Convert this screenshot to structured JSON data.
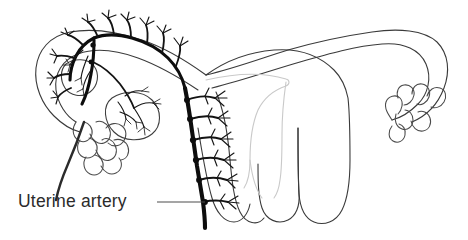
{
  "figure": {
    "kind": "anatomical-line-drawing",
    "background_color": "#ffffff",
    "orientation": "anterior view, coronal section of uterus"
  },
  "labels": [
    {
      "id": "uterine-artery",
      "text": "Uterine artery",
      "x": 18,
      "y": 207,
      "color": "#2b2b2b",
      "font_size_px": 17.5,
      "leader": {
        "from_x": 157,
        "from_y": 202,
        "to_x": 205,
        "to_y": 202,
        "color": "#4c4c4c"
      }
    }
  ],
  "colors": {
    "organ_outline": "#3a3a3a",
    "cavity_outline": "#c9c9c9",
    "artery": "#0d0d0d",
    "artery_branch": "#131313",
    "label_text": "#2b2b2b",
    "leader_line": "#4c4c4c",
    "background": "#ffffff"
  },
  "structures": [
    {
      "id": "left-fallopian-tube",
      "name": "Left fallopian tube",
      "side": "left",
      "rendering": "dark outline"
    },
    {
      "id": "right-fallopian-tube",
      "name": "Right fallopian tube",
      "side": "right",
      "rendering": "dark outline"
    },
    {
      "id": "left-fimbriae",
      "name": "Left fimbriae",
      "side": "left",
      "rendering": "finger-like outline"
    },
    {
      "id": "right-fimbriae",
      "name": "Right fimbriae",
      "side": "right",
      "rendering": "finger-like outline"
    },
    {
      "id": "left-ovary",
      "name": "Left ovary",
      "side": "left",
      "rendering": "oval outline with vessels"
    },
    {
      "id": "uterine-body",
      "name": "Uterine body",
      "side": "center",
      "rendering": "dark outline"
    },
    {
      "id": "uterine-cavity",
      "name": "Uterine cavity",
      "side": "center",
      "rendering": "pale gray triangular outline"
    },
    {
      "id": "cervix",
      "name": "Cervix",
      "side": "center",
      "rendering": "dark outline, lower lobe"
    },
    {
      "id": "uterine-artery-trunk",
      "name": "Uterine artery ascending trunk",
      "side": "left",
      "rendering": "heavy black line with nodes"
    },
    {
      "id": "arcuate-arteries",
      "name": "Arcuate arteries",
      "side": "left",
      "rendering": "branching black twigs"
    },
    {
      "id": "tubal-artery-arcade",
      "name": "Tubal artery arcade",
      "side": "left",
      "rendering": "black arcade along tube"
    },
    {
      "id": "ovarian-artery-branch",
      "name": "Ovarian artery branch",
      "side": "left",
      "rendering": "black branch to ovary"
    }
  ]
}
